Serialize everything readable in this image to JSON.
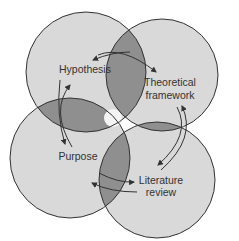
{
  "diagram": {
    "type": "overlapping-circles-cycle",
    "colors": {
      "circle_fill": "#d9d9d9",
      "overlap_fill": "#8f8f8f",
      "stroke": "#333333",
      "center": "#ffffff"
    },
    "nodes": [
      {
        "id": "hypothesis",
        "label_lines": [
          "Hypothesis"
        ]
      },
      {
        "id": "theoretical",
        "label_lines": [
          "Theoretical",
          "framework"
        ]
      },
      {
        "id": "purpose",
        "label_lines": [
          "Purpose"
        ]
      },
      {
        "id": "literature",
        "label_lines": [
          "Literature",
          "review"
        ]
      }
    ],
    "connections": [
      {
        "from": "hypothesis",
        "to": "theoretical",
        "bidirectional": true
      },
      {
        "from": "theoretical",
        "to": "literature",
        "bidirectional": true
      },
      {
        "from": "literature",
        "to": "purpose",
        "bidirectional": true
      },
      {
        "from": "purpose",
        "to": "hypothesis",
        "bidirectional": true
      }
    ]
  }
}
